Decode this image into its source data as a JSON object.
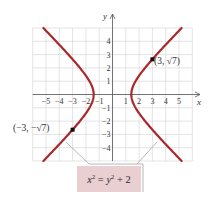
{
  "chart_data": {
    "type": "line",
    "title": "",
    "equation": {
      "lhs_var": "x",
      "lhs_exp": "2",
      "eq": " = ",
      "rhs_var": "y",
      "rhs_exp": "2",
      "rhs_rest": " + 2"
    },
    "xlabel": "x",
    "ylabel": "y",
    "xlim": [
      -6,
      6
    ],
    "ylim": [
      -5,
      5
    ],
    "grid": true,
    "x_ticks": [
      "−5",
      "−4",
      "−3",
      "−2",
      "−1",
      "1",
      "2",
      "3",
      "4",
      "5"
    ],
    "y_ticks": [
      "4",
      "3",
      "2",
      "1",
      "−1",
      "−2",
      "−3",
      "−4"
    ],
    "series": [
      {
        "name": "right branch",
        "curve": "x = sqrt(y^2 + 2)",
        "y_range": [
          -5,
          5
        ],
        "color": "#a8282c"
      },
      {
        "name": "left branch",
        "curve": "x = -sqrt(y^2 + 2)",
        "y_range": [
          -5,
          5
        ],
        "color": "#a8282c"
      }
    ],
    "points": [
      {
        "x": 3,
        "y": 2.646,
        "label": "(3, √7)"
      },
      {
        "x": -3,
        "y": -2.646,
        "label": "(−3, −√7)"
      }
    ],
    "annotation": "x² = y² + 2"
  },
  "labels": {
    "x_axis": "x",
    "y_axis": "y",
    "point_right": "(3, √7)",
    "point_left": "(−3, −√7)"
  },
  "colors": {
    "curve": "#a8282c",
    "grid": "#d9d9d9",
    "axis": "#555555",
    "label_box": "#e9cfd2"
  }
}
